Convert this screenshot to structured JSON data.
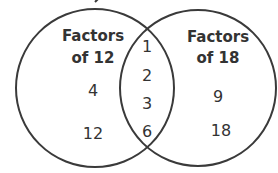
{
  "diagram": {
    "type": "venn",
    "stroke_color": "#3a3a3a",
    "text_color": "#333333",
    "sets": [
      {
        "name": "left-set",
        "title_line1": "Factors",
        "title_line2": "of 12",
        "only": [
          "4",
          "12"
        ]
      },
      {
        "name": "right-set",
        "title_line1": "Factors",
        "title_line2": "of 18",
        "only": [
          "9",
          "18"
        ]
      }
    ],
    "intersection": [
      "1",
      "2",
      "3",
      "6"
    ]
  }
}
